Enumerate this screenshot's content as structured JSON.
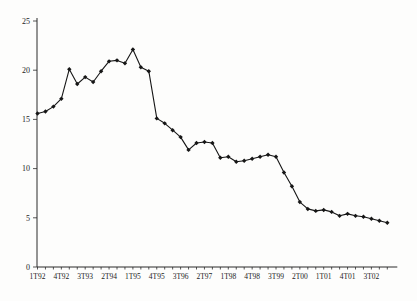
{
  "chart_data": {
    "type": "line",
    "title": "",
    "xlabel": "",
    "ylabel": "",
    "categories": [
      "1T92",
      "2T92",
      "3T92",
      "4T92",
      "1T93",
      "2T93",
      "3T93",
      "4T93",
      "1T94",
      "2T94",
      "3T94",
      "4T94",
      "1T95",
      "2T95",
      "3T95",
      "4T95",
      "1T96",
      "2T96",
      "3T96",
      "4T96",
      "1T97",
      "2T97",
      "3T97",
      "4T97",
      "1T98",
      "2T98",
      "3T98",
      "4T98",
      "1T99",
      "2T99",
      "3T99",
      "4T99",
      "1T00",
      "2T00",
      "3T00",
      "4T00",
      "1T01",
      "2T01",
      "3T01",
      "4T01",
      "1T02",
      "2T02",
      "3T02",
      "4T02",
      "1T03"
    ],
    "values": [
      15.6,
      15.8,
      16.3,
      17.1,
      20.1,
      18.6,
      19.3,
      18.8,
      19.9,
      20.9,
      21.0,
      20.7,
      22.1,
      20.3,
      19.9,
      15.1,
      14.6,
      13.9,
      13.2,
      11.9,
      12.6,
      12.7,
      12.6,
      11.1,
      11.2,
      10.7,
      10.8,
      11.0,
      11.2,
      11.4,
      11.2,
      9.6,
      8.2,
      6.6,
      5.9,
      5.7,
      5.8,
      5.6,
      5.2,
      5.4,
      5.2,
      5.1,
      4.9,
      4.7,
      4.5
    ],
    "x_tick_labels_shown": [
      "1T92",
      "4T92",
      "3T93",
      "2T94",
      "1T95",
      "4T95",
      "3T96",
      "2T97",
      "1T98",
      "4T98",
      "3T99",
      "2T00",
      "1T01",
      "4T01",
      "3T02"
    ],
    "x_label_every_n_points": 3,
    "yticks": [
      0,
      5,
      10,
      15,
      20,
      25
    ],
    "ylim": [
      0,
      25
    ],
    "grid": false,
    "legend_position": "none",
    "line_color": "#161616",
    "marker_shape": "diamond",
    "marker_color": "#161616",
    "background_color": "#fdfdfc"
  }
}
